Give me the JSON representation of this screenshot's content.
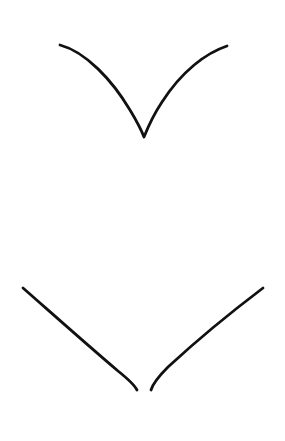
{
  "document": {
    "kind": "line-drawing",
    "title": "Two chevron line strokes",
    "background_color": "#ffffff",
    "ink_color": "#111111",
    "canvas": {
      "width": 285,
      "height": 441
    }
  },
  "drawing_data": {
    "type": "path-figure",
    "stroke_color": "#111111",
    "background_color": "#ffffff",
    "default_stroke_width": 2.8,
    "shapes": [
      {
        "id": "upper-chevron",
        "name": "upper-v-stroke",
        "description": "Single connected V with curved arms, sharp vertex near center",
        "connected": true,
        "stroke_width": 2.8,
        "vertex": {
          "x": 144,
          "y": 137
        },
        "endpoints": [
          {
            "x": 60,
            "y": 45
          },
          {
            "x": 227,
            "y": 46
          }
        ],
        "path": "M 60 45 C 86 52 112 80 130 110 C 136 120 141 129 144 137 C 148 127 154 114 162 102 C 182 71 206 53 227 46"
      },
      {
        "id": "lower-chevron-left",
        "name": "lower-left-stroke",
        "description": "Nearly straight descending stroke that steepens to vertical at its lower end",
        "connected": false,
        "stroke_width": 2.8,
        "endpoints": [
          {
            "x": 23,
            "y": 288
          },
          {
            "x": 137,
            "y": 390
          }
        ],
        "path": "M 23 288 C 56 317 92 349 118 371 C 128 379 134 384 137 390"
      },
      {
        "id": "lower-chevron-right",
        "name": "lower-right-stroke",
        "description": "Nearly straight ascending stroke that steepens to vertical at its lower end",
        "connected": false,
        "stroke_width": 2.8,
        "endpoints": [
          {
            "x": 151,
            "y": 390
          },
          {
            "x": 263,
            "y": 288
          }
        ],
        "path": "M 151 390 C 153 383 159 376 168 367 C 194 343 230 313 263 288"
      }
    ],
    "gaps": [
      {
        "id": "lower-vertex-gap",
        "between": [
          "lower-chevron-left",
          "lower-chevron-right"
        ],
        "approx_center": {
          "x": 144,
          "y": 390
        },
        "approx_width_px": 14
      }
    ]
  }
}
